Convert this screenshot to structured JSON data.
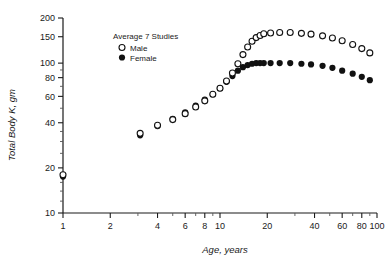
{
  "chart_data": {
    "type": "scatter",
    "title": "",
    "xlabel": "Age, years",
    "ylabel": "Total Body K, gm",
    "xscale": "log",
    "yscale": "log",
    "xlim": [
      1,
      100
    ],
    "ylim": [
      10,
      200
    ],
    "grid": false,
    "xticks": [
      1,
      2,
      4,
      6,
      8,
      10,
      20,
      40,
      60,
      80,
      100
    ],
    "xticklabels": [
      "1",
      "2",
      "4",
      "6",
      "8",
      "10",
      "20",
      "40",
      "60",
      "80",
      "100"
    ],
    "xminorticks": [
      3,
      5,
      7,
      9,
      30,
      50,
      70,
      90
    ],
    "yticks": [
      10,
      20,
      40,
      60,
      80,
      100,
      150,
      200
    ],
    "yticklabels": [
      "10",
      "20",
      "40",
      "60",
      "80",
      "100",
      "150",
      "200"
    ],
    "yminorticks": [
      12,
      14,
      16,
      18,
      25,
      30,
      35,
      50,
      70,
      90
    ],
    "annotation": "Average  7  Studies",
    "legend_position": "upper-center-left",
    "legend": [
      {
        "name": "Male",
        "marker": "open-circle",
        "color": "#111111"
      },
      {
        "name": "Female",
        "marker": "filled-circle",
        "color": "#111111"
      }
    ],
    "series": [
      {
        "name": "Male",
        "marker": "open-circle",
        "color": "#111111",
        "points": [
          [
            1.0,
            18.0
          ],
          [
            3.1,
            34.0
          ],
          [
            4.0,
            38.5
          ],
          [
            5.0,
            42.0
          ],
          [
            6.0,
            46.0
          ],
          [
            7.0,
            51.0
          ],
          [
            8.0,
            56.0
          ],
          [
            9.0,
            62.0
          ],
          [
            10.0,
            68.0
          ],
          [
            11.0,
            76.0
          ],
          [
            12.0,
            86.0
          ],
          [
            13.0,
            99.0
          ],
          [
            14.0,
            114.0
          ],
          [
            15.0,
            128.0
          ],
          [
            16.0,
            140.0
          ],
          [
            17.0,
            148.0
          ],
          [
            18.0,
            153.0
          ],
          [
            19.0,
            157.0
          ],
          [
            21.0,
            159.0
          ],
          [
            24.0,
            160.0
          ],
          [
            28.0,
            160.0
          ],
          [
            33.0,
            158.0
          ],
          [
            38.0,
            156.0
          ],
          [
            45.0,
            152.0
          ],
          [
            52.0,
            147.0
          ],
          [
            60.0,
            141.0
          ],
          [
            70.0,
            133.0
          ],
          [
            80.0,
            125.0
          ],
          [
            90.0,
            117.0
          ]
        ]
      },
      {
        "name": "Female",
        "marker": "filled-circle",
        "color": "#111111",
        "points": [
          [
            1.0,
            17.5
          ],
          [
            3.1,
            33.0
          ],
          [
            4.0,
            38.0
          ],
          [
            5.0,
            42.5
          ],
          [
            6.0,
            47.0
          ],
          [
            7.0,
            52.0
          ],
          [
            8.0,
            57.0
          ],
          [
            9.0,
            62.0
          ],
          [
            10.0,
            68.0
          ],
          [
            11.0,
            75.0
          ],
          [
            12.0,
            82.0
          ],
          [
            13.0,
            89.0
          ],
          [
            14.0,
            94.0
          ],
          [
            15.0,
            97.0
          ],
          [
            16.0,
            99.0
          ],
          [
            17.0,
            100.0
          ],
          [
            18.0,
            100.0
          ],
          [
            19.0,
            100.0
          ],
          [
            21.0,
            100.0
          ],
          [
            24.0,
            100.0
          ],
          [
            28.0,
            100.0
          ],
          [
            33.0,
            99.0
          ],
          [
            38.0,
            98.0
          ],
          [
            45.0,
            96.0
          ],
          [
            52.0,
            93.0
          ],
          [
            60.0,
            89.0
          ],
          [
            70.0,
            85.0
          ],
          [
            80.0,
            81.0
          ],
          [
            90.0,
            77.0
          ]
        ]
      }
    ]
  }
}
